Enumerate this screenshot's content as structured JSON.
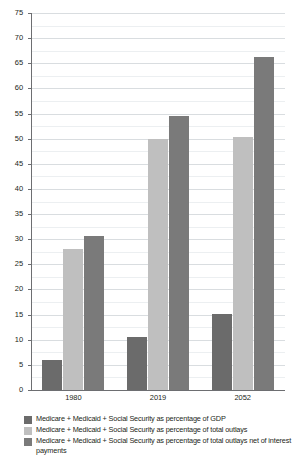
{
  "chart_data": {
    "type": "bar",
    "title": "",
    "subtitle": "",
    "xlabel": "",
    "ylabel": "",
    "categories": [
      "1980",
      "2019",
      "2052"
    ],
    "series": [
      {
        "name": "Medicare + Medicaid + Social Security as percentage of GDP",
        "color": "#6b6b6b",
        "values": [
          6.0,
          10.5,
          15.1
        ]
      },
      {
        "name": "Medicare + Medicaid + Social Security as percentage of total outlays",
        "color": "#bfbfbf",
        "values": [
          28.0,
          50.0,
          50.3
        ]
      },
      {
        "name": "Medicare + Medicaid + Social Security as percentage of total outlays net of interest payments",
        "color": "#7a7a7a",
        "values": [
          30.7,
          54.6,
          66.2
        ]
      }
    ],
    "ylim": [
      0,
      75
    ],
    "y_major_step": 5,
    "y_minor_step": 2.5,
    "y_tick_labels": [
      "0",
      "5",
      "10",
      "15",
      "20",
      "25",
      "30",
      "35",
      "40",
      "45",
      "50",
      "55",
      "60",
      "65",
      "70",
      "75"
    ],
    "grid": true,
    "legend_position": "bottom",
    "axis_color": "#6d6e71",
    "gridline_color": "#d9dde0",
    "background": "#ffffff"
  },
  "legend": {
    "entries": [
      {
        "label": "Medicare + Medicaid + Social Security as percentage of GDP",
        "color": "#6b6b6b"
      },
      {
        "label": "Medicare + Medicaid + Social Security as percentage of total outlays",
        "color": "#bfbfbf"
      },
      {
        "label": "Medicare + Medicaid + Social Security as percentage of total outlays net of interest payments",
        "color": "#7a7a7a"
      }
    ]
  }
}
